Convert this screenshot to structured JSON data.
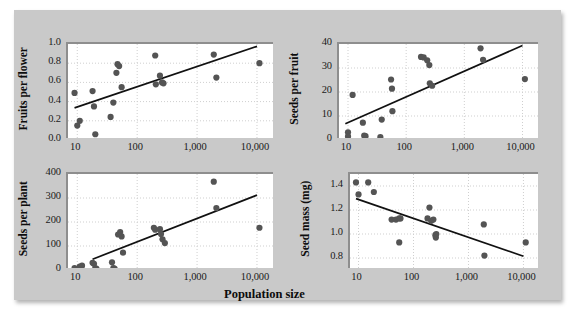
{
  "figure": {
    "xlabel": "Population size",
    "background_color": "#c9c9c9",
    "plot_background_color": "#ffffff",
    "point_color": "#545454",
    "line_color": "#111111",
    "grid_color": "#cfcfcf"
  },
  "chart_data": [
    {
      "type": "scatter",
      "panel": "top-left",
      "title": "",
      "xlabel": "Population size",
      "ylabel": "Fruits per flower",
      "xscale": "log",
      "xlim": [
        7,
        20000
      ],
      "ylim": [
        0.0,
        1.0
      ],
      "xticks": [
        10,
        100,
        1000,
        10000
      ],
      "xticklabels": [
        "10",
        "100",
        "1,000",
        "10,000"
      ],
      "yticks": [
        0.0,
        0.2,
        0.4,
        0.6,
        0.8,
        1.0
      ],
      "yticklabels": [
        "0.0",
        "0.2",
        "0.4",
        "0.6",
        "0.8",
        "1.0"
      ],
      "grid": true,
      "legend": "none",
      "points": [
        [
          9,
          0.49
        ],
        [
          10,
          0.15
        ],
        [
          11,
          0.2
        ],
        [
          18,
          0.51
        ],
        [
          19,
          0.35
        ],
        [
          20,
          0.06
        ],
        [
          36,
          0.24
        ],
        [
          40,
          0.39
        ],
        [
          45,
          0.7
        ],
        [
          47,
          0.79
        ],
        [
          50,
          0.77
        ],
        [
          55,
          0.55
        ],
        [
          200,
          0.88
        ],
        [
          205,
          0.58
        ],
        [
          240,
          0.67
        ],
        [
          260,
          0.6
        ],
        [
          275,
          0.59
        ],
        [
          1900,
          0.89
        ],
        [
          2100,
          0.65
        ],
        [
          11000,
          0.8
        ]
      ],
      "trendline": {
        "x": [
          9,
          10000
        ],
        "y": [
          0.335,
          0.975
        ]
      }
    },
    {
      "type": "scatter",
      "panel": "top-right",
      "title": "",
      "xlabel": "Population size",
      "ylabel": "Seeds per fruit",
      "xscale": "log",
      "xlim": [
        7,
        20000
      ],
      "ylim": [
        0,
        40
      ],
      "xticks": [
        10,
        100,
        1000,
        10000
      ],
      "xticklabels": [
        "10",
        "100",
        "1,000",
        "10,000"
      ],
      "yticks": [
        0,
        10,
        20,
        30,
        40
      ],
      "yticklabels": [
        "0",
        "10",
        "20",
        "30",
        "40"
      ],
      "grid": true,
      "legend": "none",
      "points": [
        [
          10,
          3.2
        ],
        [
          10,
          1.5
        ],
        [
          12,
          18.8
        ],
        [
          18,
          7.2
        ],
        [
          19,
          1.8
        ],
        [
          20,
          1.6
        ],
        [
          36,
          1.2
        ],
        [
          38,
          8.5
        ],
        [
          55,
          25.2
        ],
        [
          57,
          21.4
        ],
        [
          58,
          12.0
        ],
        [
          180,
          34.6
        ],
        [
          200,
          34.4
        ],
        [
          230,
          33.2
        ],
        [
          250,
          31.2
        ],
        [
          255,
          23.6
        ],
        [
          280,
          22.6
        ],
        [
          1900,
          38.2
        ],
        [
          2100,
          33.4
        ],
        [
          11000,
          25.4
        ]
      ],
      "trendline": {
        "x": [
          9,
          10000
        ],
        "y": [
          6.8,
          39.4
        ]
      }
    },
    {
      "type": "scatter",
      "panel": "bottom-left",
      "title": "",
      "xlabel": "Population size",
      "ylabel": "Seeds per plant",
      "xscale": "log",
      "xlim": [
        7,
        20000
      ],
      "ylim": [
        0,
        400
      ],
      "xticks": [
        10,
        100,
        1000,
        10000
      ],
      "xticklabels": [
        "10",
        "100",
        "1,000",
        "10,000"
      ],
      "yticks": [
        0,
        100,
        200,
        300,
        400
      ],
      "yticklabels": [
        "0",
        "100",
        "200",
        "300",
        "400"
      ],
      "grid": true,
      "legend": "none",
      "points": [
        [
          9,
          8
        ],
        [
          11,
          14
        ],
        [
          12,
          18
        ],
        [
          18,
          30
        ],
        [
          19,
          26
        ],
        [
          20,
          8
        ],
        [
          21,
          5
        ],
        [
          38,
          32
        ],
        [
          40,
          8
        ],
        [
          42,
          6
        ],
        [
          48,
          148
        ],
        [
          52,
          158
        ],
        [
          55,
          140
        ],
        [
          58,
          72
        ],
        [
          190,
          176
        ],
        [
          200,
          168
        ],
        [
          240,
          170
        ],
        [
          250,
          150
        ],
        [
          265,
          128
        ],
        [
          290,
          112
        ],
        [
          1900,
          368
        ],
        [
          2100,
          258
        ],
        [
          11000,
          176
        ]
      ],
      "trendline": {
        "x": [
          18,
          10000
        ],
        "y": [
          45,
          312
        ]
      }
    },
    {
      "type": "scatter",
      "panel": "bottom-right",
      "title": "",
      "xlabel": "Population size",
      "ylabel": "Seed mass (mg)",
      "xscale": "log",
      "xlim": [
        7,
        20000
      ],
      "ylim": [
        0.7,
        1.5
      ],
      "xticks": [
        10,
        100,
        1000,
        10000
      ],
      "xticklabels": [
        "10",
        "100",
        "1,000",
        "10,000"
      ],
      "yticks": [
        0.8,
        1.0,
        1.2,
        1.4
      ],
      "yticklabels": [
        "0.8",
        "1.0",
        "1.2",
        "1.4"
      ],
      "grid": true,
      "legend": "none",
      "points": [
        [
          9,
          1.43
        ],
        [
          10,
          1.33
        ],
        [
          15,
          1.43
        ],
        [
          19,
          1.35
        ],
        [
          40,
          1.12
        ],
        [
          48,
          1.12
        ],
        [
          55,
          1.13
        ],
        [
          58,
          1.13
        ],
        [
          55,
          0.93
        ],
        [
          180,
          1.13
        ],
        [
          195,
          1.22
        ],
        [
          210,
          1.11
        ],
        [
          230,
          1.12
        ],
        [
          250,
          0.99
        ],
        [
          255,
          0.97
        ],
        [
          260,
          1.0
        ],
        [
          1900,
          1.08
        ],
        [
          1950,
          0.82
        ],
        [
          11000,
          0.93
        ]
      ],
      "trendline": {
        "x": [
          9,
          10000
        ],
        "y": [
          1.295,
          0.815
        ]
      }
    }
  ]
}
